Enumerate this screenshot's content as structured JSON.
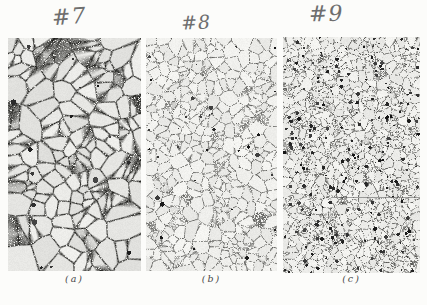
{
  "figure": {
    "panels": [
      {
        "label": "#7",
        "caption": "(a)",
        "grain_size": "coarse"
      },
      {
        "label": "#8",
        "caption": "(b)",
        "grain_size": "medium"
      },
      {
        "label": "#9",
        "caption": "(c)",
        "grain_size": "fine"
      }
    ],
    "colors": {
      "page_background": "#fcfcfa",
      "micrograph_base": "#e9e8e4",
      "grain_boundary": "#3c3c3c",
      "handwriting_ink": "#6e6e6e",
      "caption_ink": "#474747"
    }
  }
}
